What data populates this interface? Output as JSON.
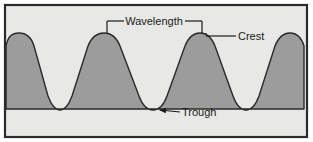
{
  "figure": {
    "frame": {
      "border_color": "#2b2b2b",
      "border_width": 2,
      "x": 4,
      "y": 4,
      "width": 304,
      "height": 134
    },
    "colors": {
      "page_background": "#ffffff",
      "sky_background": "#e8e8e6",
      "wave_fill": "#9c9c9c",
      "stroke": "#2a2a2a",
      "text": "#1a1a1a"
    }
  },
  "wave": {
    "crest_y": 33,
    "trough_y": 109,
    "crest_positions": [
      12,
      107,
      202,
      295
    ],
    "trough_positions": [
      60,
      155,
      248
    ],
    "wavelength_px": 95,
    "amplitude_px": 76,
    "path": "M 6,109 L 6,46 C 8,36 12,33 19,33 C 26,33 31,36 34,46 L 48,96 C 52,107 56,110 60,110 C 64,110 68,107 72,96 L 88,46 C 92,36 97,33 104,33 C 111,33 116,36 120,46 L 139,96 C 143,107 148,110 153,110 C 158,110 163,107 167,96 L 185,46 C 189,36 194,33 200,33 C 206,33 211,36 215,46 L 233,96 C 237,107 241,110 246,110 C 251,110 255,107 259,96 L 275,46 C 279,36 284,33 290,33 C 296,33 301,36 304,46 L 304,109 Z"
  },
  "annotations": [
    {
      "id": "wavelength",
      "label": "Wavelength",
      "kind": "bracket",
      "text_x": 154,
      "text_y": 25,
      "bracket": {
        "left_x": 107,
        "right_x": 202,
        "bar_y": 21,
        "tick_bottom_y": 33,
        "gap_left_x": 124,
        "gap_right_x": 185
      }
    },
    {
      "id": "crest",
      "label": "Crest",
      "kind": "leader",
      "text_x": 238,
      "text_y": 40,
      "leader": {
        "from_x": 206,
        "from_y": 36,
        "to_x": 236,
        "to_y": 36,
        "arrow": false
      }
    },
    {
      "id": "trough",
      "label": "Trough",
      "kind": "leader",
      "text_x": 182,
      "text_y": 116,
      "leader": {
        "from_x": 160,
        "from_y": 110,
        "to_x": 180,
        "to_y": 112,
        "arrow": true,
        "arrow_tip_x": 159,
        "arrow_tip_y": 110
      }
    }
  ]
}
